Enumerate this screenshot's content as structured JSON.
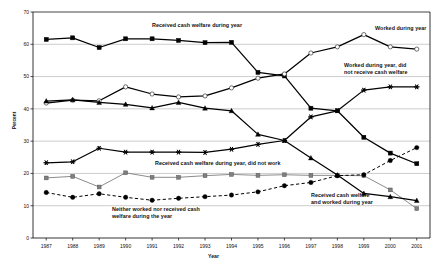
{
  "chart_data": {
    "type": "line",
    "title": "",
    "xlabel": "Year",
    "ylabel": "Percent",
    "ylim": [
      0,
      70
    ],
    "ytick_step": 10,
    "grid": "horizontal",
    "legend_position": "inline-annotations",
    "categories": [
      "1987",
      "1988",
      "1989",
      "1990",
      "1991",
      "1992",
      "1993",
      "1994",
      "1995",
      "1996",
      "1997",
      "1998",
      "1999",
      "2000",
      "2001"
    ],
    "yticks": [
      "0",
      "10",
      "20",
      "30",
      "40",
      "50",
      "60",
      "70"
    ],
    "series": [
      {
        "name": "Received cash welfare during year",
        "marker": "filled-square",
        "line": "solid",
        "values": [
          61.5,
          62.0,
          59.0,
          61.7,
          61.7,
          61.2,
          60.5,
          60.6,
          51.3,
          50.2,
          40.2,
          39.4,
          31.2,
          26.3,
          23.0
        ]
      },
      {
        "name": "Worked during year",
        "marker": "open-circle",
        "line": "solid",
        "values": [
          41.8,
          42.7,
          42.5,
          46.8,
          44.6,
          43.7,
          44.0,
          46.5,
          49.5,
          50.8,
          57.3,
          59.2,
          63.0,
          59.2,
          58.5
        ]
      },
      {
        "name": "Worked during year, did not receive cash welfare",
        "marker": "star-asterisk",
        "line": "solid",
        "values": [
          23.3,
          23.6,
          27.8,
          26.6,
          26.6,
          26.6,
          26.5,
          27.5,
          29.0,
          30.2,
          37.5,
          39.4,
          45.8,
          46.8,
          46.8
        ]
      },
      {
        "name": "Received cash welfare during year, did not work",
        "marker": "filled-square-gray",
        "line": "solid-gray",
        "values": [
          18.6,
          19.1,
          15.8,
          20.2,
          18.8,
          18.8,
          19.3,
          19.7,
          19.4,
          19.6,
          19.4,
          19.4,
          19.3,
          14.9,
          9.1
        ]
      },
      {
        "name": "Received cash welfare and worked during year",
        "marker": "filled-triangle",
        "line": "solid",
        "values": [
          42.4,
          42.8,
          42.0,
          41.4,
          40.3,
          42.0,
          40.2,
          39.4,
          32.1,
          30.2,
          24.8,
          19.5,
          13.8,
          12.8,
          11.6
        ]
      },
      {
        "name": "Neither worked nor received cash welfare during the year",
        "marker": "filled-circle",
        "line": "dashed",
        "values": [
          14.1,
          12.6,
          13.7,
          12.6,
          11.7,
          12.3,
          12.8,
          13.3,
          14.3,
          16.2,
          17.2,
          19.3,
          19.6,
          24.0,
          28.0
        ]
      }
    ],
    "annotations": [
      {
        "id": "ann-received-cash-welfare",
        "text": "Received cash welfare during year"
      },
      {
        "id": "ann-worked-during-year",
        "text": "Worked during year"
      },
      {
        "id": "ann-worked-not-welfare",
        "text": "Worked during year, did\nnot receive cash welfare"
      },
      {
        "id": "ann-welfare-not-work",
        "text": "Received cash welfare during year, did not work"
      },
      {
        "id": "ann-welfare-and-worked",
        "text": "Received cash welfare\nand worked during year"
      },
      {
        "id": "ann-neither",
        "text": "Neither worked nor received cash\nwelfare during the year"
      }
    ]
  },
  "axis": {
    "x_title": "Year",
    "y_title": "Percent"
  },
  "colors": {
    "series_dark": "#000000",
    "series_gray": "#7f7f7f",
    "gridline": "#9a9a9a",
    "axis": "#000000",
    "background": "#ffffff"
  }
}
